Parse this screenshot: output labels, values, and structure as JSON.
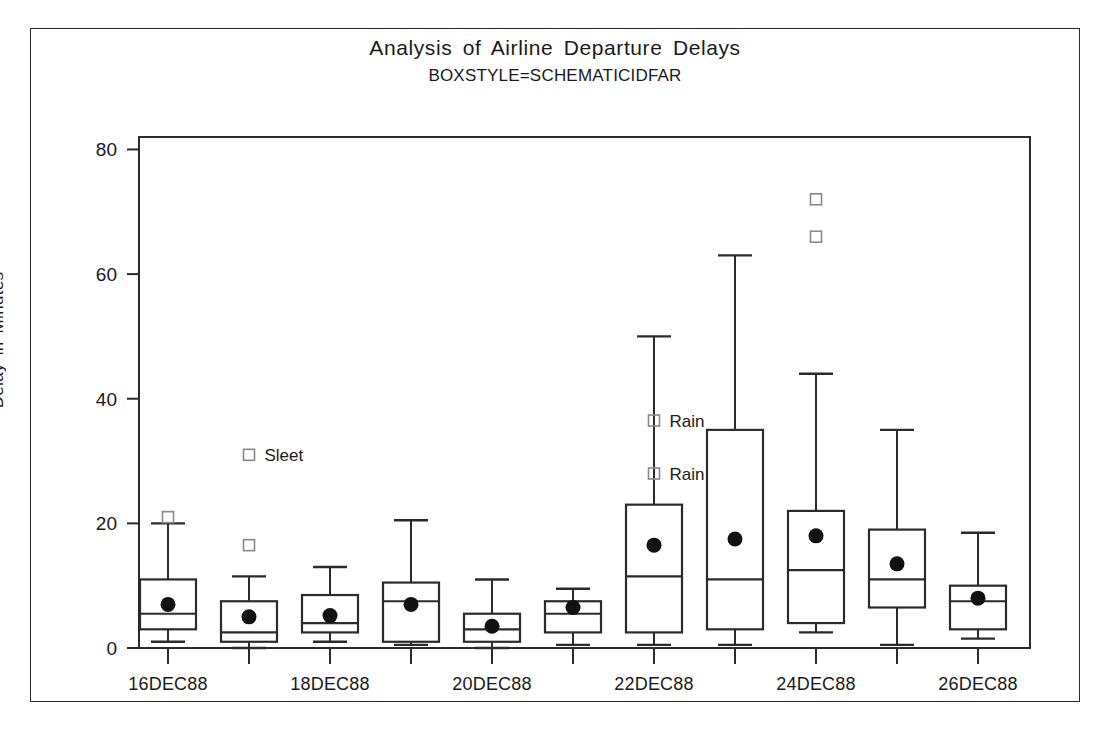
{
  "chart_data": {
    "type": "box",
    "title": "Analysis of Airline Departure Delays",
    "subtitle": "BOXSTYLE=SCHEMATICIDFAR",
    "xlabel": "",
    "ylabel": "Delay in Minutes",
    "ylim": [
      0,
      82
    ],
    "yticks": [
      0,
      20,
      40,
      60,
      80
    ],
    "ytick_labels": [
      "0",
      "20",
      "40",
      "60",
      "80"
    ],
    "grid": false,
    "legend": "none",
    "categories": [
      "16DEC88",
      "",
      "18DEC88",
      "",
      "20DEC88",
      "",
      "22DEC88",
      "",
      "24DEC88",
      "",
      "26DEC88"
    ],
    "xtick_labels_shown": [
      "16DEC88",
      "18DEC88",
      "20DEC88",
      "22DEC88",
      "24DEC88",
      "26DEC88"
    ],
    "marker_style": "mean-filled-circle",
    "outlier_style": "open-square",
    "boxes": [
      {
        "category": "16DEC88",
        "whisker_low": 1.0,
        "q1": 3.0,
        "median": 5.5,
        "q3": 11.0,
        "whisker_high": 20.0,
        "mean": 7.0,
        "outliers": [
          21.0
        ],
        "outlier_labels": [
          ""
        ]
      },
      {
        "category": "17DEC88",
        "whisker_low": 0.0,
        "q1": 1.0,
        "median": 2.5,
        "q3": 7.5,
        "whisker_high": 11.5,
        "mean": 5.0,
        "outliers": [
          16.5,
          31.0
        ],
        "outlier_labels": [
          "",
          "Sleet"
        ]
      },
      {
        "category": "18DEC88",
        "whisker_low": 1.0,
        "q1": 2.5,
        "median": 4.0,
        "q3": 8.5,
        "whisker_high": 13.0,
        "mean": 5.2,
        "outliers": [],
        "outlier_labels": []
      },
      {
        "category": "19DEC88",
        "whisker_low": 0.5,
        "q1": 1.0,
        "median": 7.5,
        "q3": 10.5,
        "whisker_high": 20.5,
        "mean": 7.0,
        "outliers": [],
        "outlier_labels": []
      },
      {
        "category": "20DEC88",
        "whisker_low": 0.0,
        "q1": 1.0,
        "median": 3.0,
        "q3": 5.5,
        "whisker_high": 11.0,
        "mean": 3.5,
        "outliers": [],
        "outlier_labels": []
      },
      {
        "category": "21DEC88",
        "whisker_low": 0.5,
        "q1": 2.5,
        "median": 5.5,
        "q3": 7.5,
        "whisker_high": 9.5,
        "mean": 6.5,
        "outliers": [],
        "outlier_labels": []
      },
      {
        "category": "22DEC88",
        "whisker_low": 0.5,
        "q1": 2.5,
        "median": 11.5,
        "q3": 23.0,
        "whisker_high": 50.0,
        "mean": 16.5,
        "outliers": [
          28.0,
          36.5
        ],
        "outlier_labels": [
          "Rain",
          "Rain"
        ]
      },
      {
        "category": "23DEC88",
        "whisker_low": 0.5,
        "q1": 3.0,
        "median": 11.0,
        "q3": 35.0,
        "whisker_high": 63.0,
        "mean": 17.5,
        "outliers": [],
        "outlier_labels": []
      },
      {
        "category": "24DEC88",
        "whisker_low": 2.5,
        "q1": 4.0,
        "median": 12.5,
        "q3": 22.0,
        "whisker_high": 44.0,
        "mean": 18.0,
        "outliers": [
          66.0,
          72.0
        ],
        "outlier_labels": [
          "",
          ""
        ]
      },
      {
        "category": "25DEC88",
        "whisker_low": 0.5,
        "q1": 6.5,
        "median": 11.0,
        "q3": 19.0,
        "whisker_high": 35.0,
        "mean": 13.5,
        "outliers": [],
        "outlier_labels": []
      },
      {
        "category": "26DEC88",
        "whisker_low": 1.5,
        "q1": 3.0,
        "median": 7.5,
        "q3": 10.0,
        "whisker_high": 18.5,
        "mean": 8.0,
        "outliers": [],
        "outlier_labels": []
      }
    ],
    "annotations": [
      {
        "text": "Sleet",
        "value": 31.0,
        "category": "17DEC88"
      },
      {
        "text": "Rain",
        "value": 36.5,
        "category": "22DEC88"
      },
      {
        "text": "Rain",
        "value": 28.0,
        "category": "22DEC88"
      }
    ],
    "colors": {
      "line": "#2b2b2b",
      "mean_marker": "#111111",
      "outlier_border": "#8a8a8a",
      "background": "#ffffff",
      "text": "#1a1a1a"
    }
  }
}
